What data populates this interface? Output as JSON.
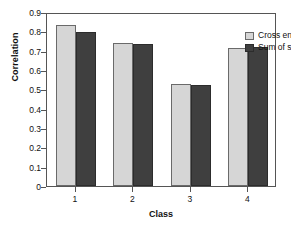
{
  "chart_data": {
    "type": "bar",
    "title": "",
    "xlabel": "Class",
    "ylabel": "Correlation",
    "categories": [
      "1",
      "2",
      "3",
      "4"
    ],
    "series": [
      {
        "name": "Cross entropy",
        "color": "#d6d6d6",
        "values": [
          0.835,
          0.742,
          0.528,
          0.713
        ]
      },
      {
        "name": "Sum of squares",
        "color": "#3f3f3f",
        "values": [
          0.798,
          0.735,
          0.522,
          0.72
        ]
      }
    ],
    "ylim": [
      0,
      0.9
    ],
    "ytick_labels": [
      "0",
      "0.1",
      "0.2",
      "0.3",
      "0.4",
      "0.5",
      "0.6",
      "0.7",
      "0.8",
      "0.9"
    ],
    "ytick_values": [
      0,
      0.1,
      0.2,
      0.3,
      0.4,
      0.5,
      0.6,
      0.7,
      0.8,
      0.9
    ],
    "grid": false,
    "legend_position": "top-right",
    "frame": true
  },
  "axis": {
    "y_title": "Correlation",
    "x_title": "Class"
  },
  "legend": {
    "items": [
      {
        "label": "Cross entropy"
      },
      {
        "label": "Sum of squares"
      }
    ]
  }
}
